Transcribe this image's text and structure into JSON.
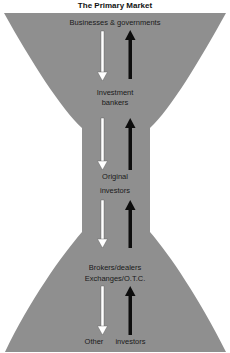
{
  "title": "The Primary Market",
  "colors": {
    "shape_fill": "#8f8f8f",
    "up_arrow": "#0d0d0d",
    "down_arrow": "#ffffff",
    "text": "#1a1a1a"
  },
  "nodes": [
    {
      "id": "issuers",
      "lines": [
        "Businesses & governments"
      ]
    },
    {
      "id": "underwriters",
      "lines": [
        "Investment",
        "bankers"
      ]
    },
    {
      "id": "original",
      "lines": [
        "Original",
        "investors"
      ]
    },
    {
      "id": "secondary",
      "lines": [
        "Brokers/dealers",
        "Exchanges/O.T.C."
      ]
    },
    {
      "id": "other",
      "lines": [
        "Other",
        "investors"
      ]
    }
  ],
  "flows": [
    {
      "from": "issuers",
      "to": "underwriters",
      "down_arrow": "white",
      "up_arrow": "black"
    },
    {
      "from": "underwriters",
      "to": "original",
      "down_arrow": "white",
      "up_arrow": "black"
    },
    {
      "from": "original",
      "to": "secondary",
      "down_arrow": "white",
      "up_arrow": "black"
    },
    {
      "from": "secondary",
      "to": "other",
      "down_arrow": "white",
      "up_arrow": "black"
    }
  ]
}
